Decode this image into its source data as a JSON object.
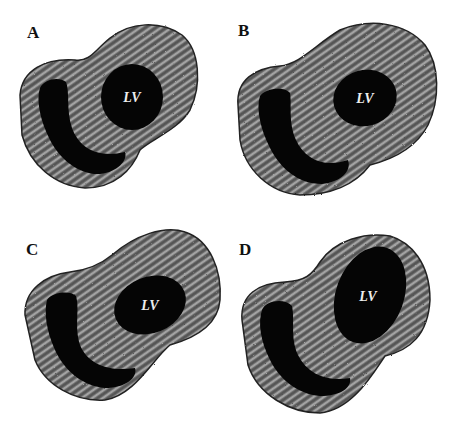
{
  "figure": {
    "panels": [
      {
        "id": "A",
        "label": "A",
        "cavity_label": "LV"
      },
      {
        "id": "B",
        "label": "B",
        "cavity_label": "LV"
      },
      {
        "id": "C",
        "label": "C",
        "cavity_label": "LV"
      },
      {
        "id": "D",
        "label": "D",
        "cavity_label": "LV"
      }
    ],
    "colors": {
      "background": "#ffffff",
      "myocardium": "#7a7a7a",
      "cavity": "#050505",
      "outline": "#222222"
    }
  }
}
